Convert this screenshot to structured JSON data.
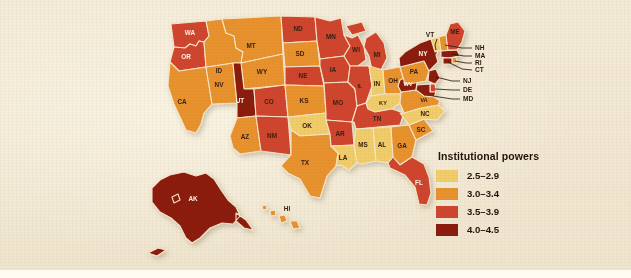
{
  "map": {
    "title": "United States choropleth of gubernatorial institutional powers",
    "background_color": "#f2e9d4",
    "border_color": "#f7e6c8"
  },
  "legend": {
    "title": "Institutional powers",
    "entries": [
      {
        "label": "2.5–2.9",
        "color": "#f0cd6a",
        "min": 2.5,
        "max": 2.9
      },
      {
        "label": "3.0–3.4",
        "color": "#e8922f",
        "min": 3.0,
        "max": 3.4
      },
      {
        "label": "3.5–3.9",
        "color": "#d0452f",
        "min": 3.5,
        "max": 3.9
      },
      {
        "label": "4.0–4.5",
        "color": "#8c1b10",
        "min": 4.0,
        "max": 4.5
      }
    ]
  },
  "chart_data": {
    "type": "map",
    "title": "Institutional powers",
    "value_field": "Institutional powers index",
    "bins": [
      "2.5–2.9",
      "3.0–3.4",
      "3.5–3.9",
      "4.0–4.5"
    ],
    "bin_colors": [
      "#f0cd6a",
      "#e8922f",
      "#d0452f",
      "#8c1b10"
    ],
    "states": [
      {
        "code": "WA",
        "bin": "3.5–3.9",
        "color": "#d0452f",
        "label_color": "light"
      },
      {
        "code": "OR",
        "bin": "3.5–3.9",
        "color": "#d0452f",
        "label_color": "light"
      },
      {
        "code": "CA",
        "bin": "3.0–3.4",
        "color": "#e8922f",
        "label_color": "dark"
      },
      {
        "code": "NV",
        "bin": "3.0–3.4",
        "color": "#e8922f",
        "label_color": "dark"
      },
      {
        "code": "ID",
        "bin": "3.0–3.4",
        "color": "#e8922f",
        "label_color": "dark"
      },
      {
        "code": "MT",
        "bin": "3.0–3.4",
        "color": "#e8922f",
        "label_color": "dark"
      },
      {
        "code": "WY",
        "bin": "3.0–3.4",
        "color": "#e8922f",
        "label_color": "dark"
      },
      {
        "code": "UT",
        "bin": "4.0–4.5",
        "color": "#8c1b10",
        "label_color": "light"
      },
      {
        "code": "AZ",
        "bin": "3.0–3.4",
        "color": "#e8922f",
        "label_color": "dark"
      },
      {
        "code": "CO",
        "bin": "3.5–3.9",
        "color": "#d0452f",
        "label_color": "dark"
      },
      {
        "code": "NM",
        "bin": "3.5–3.9",
        "color": "#d0452f",
        "label_color": "dark"
      },
      {
        "code": "ND",
        "bin": "3.5–3.9",
        "color": "#d0452f",
        "label_color": "dark"
      },
      {
        "code": "SD",
        "bin": "3.0–3.4",
        "color": "#e8922f",
        "label_color": "dark"
      },
      {
        "code": "NE",
        "bin": "3.5–3.9",
        "color": "#d0452f",
        "label_color": "dark"
      },
      {
        "code": "KS",
        "bin": "3.0–3.4",
        "color": "#e8922f",
        "label_color": "dark"
      },
      {
        "code": "OK",
        "bin": "2.5–2.9",
        "color": "#f0cd6a",
        "label_color": "dark"
      },
      {
        "code": "TX",
        "bin": "3.0–3.4",
        "color": "#e8922f",
        "label_color": "dark"
      },
      {
        "code": "MN",
        "bin": "3.5–3.9",
        "color": "#d0452f",
        "label_color": "dark"
      },
      {
        "code": "IA",
        "bin": "3.5–3.9",
        "color": "#d0452f",
        "label_color": "dark"
      },
      {
        "code": "MO",
        "bin": "3.5–3.9",
        "color": "#d0452f",
        "label_color": "dark"
      },
      {
        "code": "AR",
        "bin": "3.5–3.9",
        "color": "#d0452f",
        "label_color": "dark"
      },
      {
        "code": "LA",
        "bin": "2.5–2.9",
        "color": "#f0cd6a",
        "label_color": "dark"
      },
      {
        "code": "WI",
        "bin": "3.5–3.9",
        "color": "#d0452f",
        "label_color": "dark"
      },
      {
        "code": "IL",
        "bin": "3.5–3.9",
        "color": "#d0452f",
        "label_color": "dark"
      },
      {
        "code": "MI",
        "bin": "3.5–3.9",
        "color": "#d0452f",
        "label_color": "dark"
      },
      {
        "code": "IN",
        "bin": "2.5–2.9",
        "color": "#f0cd6a",
        "label_color": "dark"
      },
      {
        "code": "OH",
        "bin": "3.0–3.4",
        "color": "#e8922f",
        "label_color": "dark"
      },
      {
        "code": "KY",
        "bin": "2.5–2.9",
        "color": "#f0cd6a",
        "label_color": "dark"
      },
      {
        "code": "TN",
        "bin": "3.5–3.9",
        "color": "#d0452f",
        "label_color": "dark"
      },
      {
        "code": "MS",
        "bin": "2.5–2.9",
        "color": "#f0cd6a",
        "label_color": "dark"
      },
      {
        "code": "AL",
        "bin": "2.5–2.9",
        "color": "#f0cd6a",
        "label_color": "dark"
      },
      {
        "code": "GA",
        "bin": "3.0–3.4",
        "color": "#e8922f",
        "label_color": "dark"
      },
      {
        "code": "FL",
        "bin": "3.5–3.9",
        "color": "#d0452f",
        "label_color": "light"
      },
      {
        "code": "SC",
        "bin": "3.0–3.4",
        "color": "#e8922f",
        "label_color": "dark"
      },
      {
        "code": "NC",
        "bin": "2.5–2.9",
        "color": "#f0cd6a",
        "label_color": "dark"
      },
      {
        "code": "VA",
        "bin": "3.0–3.4",
        "color": "#e8922f",
        "label_color": "dark"
      },
      {
        "code": "WV",
        "bin": "4.0–4.5",
        "color": "#8c1b10",
        "label_color": "light"
      },
      {
        "code": "PA",
        "bin": "3.0–3.4",
        "color": "#e8922f",
        "label_color": "dark"
      },
      {
        "code": "NY",
        "bin": "4.0–4.5",
        "color": "#8c1b10",
        "label_color": "light"
      },
      {
        "code": "VT",
        "bin": "2.5–2.9",
        "color": "#f0cd6a",
        "label_color": "dark"
      },
      {
        "code": "ME",
        "bin": "3.5–3.9",
        "color": "#d0452f",
        "label_color": "dark"
      },
      {
        "code": "NH",
        "bin": "3.0–3.4",
        "color": "#e8922f",
        "label_color": "dark"
      },
      {
        "code": "MA",
        "bin": "4.0–4.5",
        "color": "#8c1b10",
        "label_color": "light"
      },
      {
        "code": "RI",
        "bin": "3.0–3.4",
        "color": "#e8922f",
        "label_color": "dark"
      },
      {
        "code": "CT",
        "bin": "4.0–4.5",
        "color": "#8c1b10",
        "label_color": "light"
      },
      {
        "code": "NJ",
        "bin": "4.0–4.5",
        "color": "#8c1b10",
        "label_color": "light"
      },
      {
        "code": "DE",
        "bin": "3.5–3.9",
        "color": "#d0452f",
        "label_color": "dark"
      },
      {
        "code": "MD",
        "bin": "4.0–4.5",
        "color": "#8c1b10",
        "label_color": "light"
      },
      {
        "code": "AK",
        "bin": "4.0–4.5",
        "color": "#8c1b10",
        "label_color": "light"
      },
      {
        "code": "HI",
        "bin": "3.0–3.4",
        "color": "#e8922f",
        "label_color": "dark"
      }
    ],
    "callout_states": [
      "VT",
      "ME",
      "NH",
      "MA",
      "RI",
      "CT",
      "NJ",
      "DE",
      "MD"
    ],
    "legend_position": "bottom-right"
  }
}
